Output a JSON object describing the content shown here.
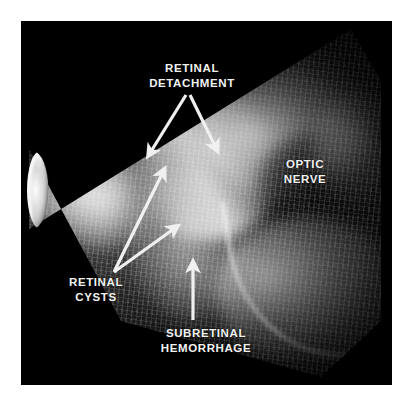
{
  "figure": {
    "type": "ocular-b-scan-ultrasound",
    "background_color": "#ffffff",
    "panel_color": "#000000",
    "annotation_color": "#f2f2f2"
  },
  "annotations": {
    "retinal_detachment": {
      "label": "RETINAL\nDETACHMENT",
      "arrow_count": 2,
      "arrow_style": "v-shaped-double"
    },
    "optic_nerve": {
      "label": "OPTIC\nNERVE",
      "arrow_count": 0,
      "arrow_style": "none"
    },
    "retinal_cysts": {
      "label": "RETINAL\nCYSTS",
      "arrow_count": 2,
      "arrow_style": "diverging-double"
    },
    "subretinal_hemorrhage": {
      "label": "SUBRETINAL\nHEMORRHAGE",
      "arrow_count": 1,
      "arrow_style": "vertical-up"
    }
  }
}
